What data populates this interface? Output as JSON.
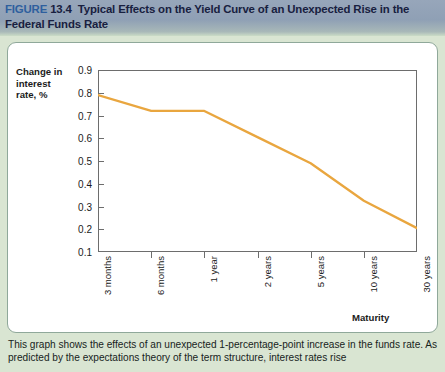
{
  "header": {
    "figure_word": "FIGURE",
    "figure_number": "13.4",
    "title": "Typical Effects on the Yield Curve of an Unexpected Rise in the Federal Funds Rate",
    "band_color": "#8fa0b5",
    "figure_word_color": "#2e5f9e",
    "title_color": "#18203f"
  },
  "page": {
    "background_color": "#d9e5d2",
    "card_background": "#ffffff",
    "card_border_color": "#8fa89a"
  },
  "chart_data": {
    "type": "line",
    "title": "",
    "subtitle": "",
    "xlabel": "Maturity",
    "ylabel": "Change in interest rate, %",
    "categories": [
      "3 months",
      "6 months",
      "1 year",
      "2 years",
      "5 years",
      "10 years",
      "30 years"
    ],
    "values": [
      0.79,
      0.72,
      0.72,
      0.605,
      0.49,
      0.325,
      0.205
    ],
    "series": [
      {
        "name": "Change in interest rate",
        "values": [
          0.79,
          0.72,
          0.72,
          0.605,
          0.49,
          0.325,
          0.205
        ],
        "color": "#e9a63f"
      }
    ],
    "yticks": [
      "0.9",
      "0.8",
      "0.7",
      "0.6",
      "0.5",
      "0.4",
      "0.3",
      "0.2",
      "0.1"
    ],
    "ylim": [
      0.1,
      0.9
    ],
    "xlim": [
      0,
      6
    ],
    "grid": false,
    "legend": "none",
    "line_color": "#e9a63f",
    "axis_color": "#6d6d6d"
  },
  "axis": {
    "y_title_line1": "Change in",
    "y_title_line2": "interest",
    "y_title_line3": "rate, %",
    "x_title": "Maturity"
  },
  "caption": {
    "line1": "This graph shows the effects of an unexpected 1-percentage-point increase in the funds",
    "line2": "rate. As predicted by the expectations theory of the term structure, interest rates rise"
  }
}
